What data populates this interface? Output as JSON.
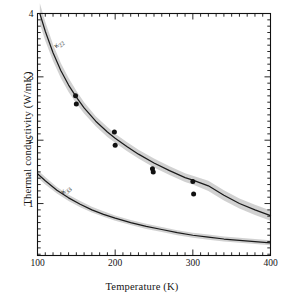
{
  "chart_data": {
    "type": "line",
    "title": "",
    "xlabel": "Temperature (K)",
    "ylabel": "Thermal conductivity (W/mK)",
    "xlim": [
      100,
      400
    ],
    "ylim": [
      0.18,
      4.0
    ],
    "grid": false,
    "legend_position": "inline-curve-labels",
    "xticks": [
      100,
      200,
      300,
      400
    ],
    "xtick_labels": [
      "100",
      "200",
      "300",
      "400"
    ],
    "yticks": [
      1,
      2,
      3,
      4
    ],
    "ytick_labels": [
      "1",
      "2",
      "3",
      "4"
    ],
    "minor_ticks": true,
    "band_color": "#c9c9c9",
    "curve_color": "#1a1a1a",
    "marker_color": "#111111",
    "series": [
      {
        "name": "kappa_22",
        "label": "κ",
        "label_sub": "22",
        "label_x": 122,
        "label_y": 3.47,
        "x": [
          103,
          110,
          120,
          130,
          140,
          150,
          160,
          175,
          190,
          200,
          215,
          230,
          250,
          270,
          290,
          300,
          320,
          340,
          360,
          380,
          400
        ],
        "values": [
          4.0,
          3.72,
          3.38,
          3.1,
          2.87,
          2.68,
          2.51,
          2.3,
          2.13,
          2.03,
          1.9,
          1.78,
          1.64,
          1.52,
          1.41,
          1.37,
          1.28,
          1.13,
          1.0,
          0.9,
          0.81
        ],
        "band_lower": [
          3.84,
          3.57,
          3.25,
          2.98,
          2.76,
          2.58,
          2.42,
          2.22,
          2.05,
          1.96,
          1.83,
          1.71,
          1.57,
          1.45,
          1.34,
          1.3,
          1.2,
          1.05,
          0.92,
          0.82,
          0.73
        ],
        "band_upper": [
          4.16,
          3.87,
          3.51,
          3.22,
          2.98,
          2.78,
          2.6,
          2.38,
          2.21,
          2.1,
          1.97,
          1.85,
          1.71,
          1.59,
          1.48,
          1.44,
          1.36,
          1.21,
          1.08,
          0.98,
          0.89
        ]
      },
      {
        "name": "kappa_33",
        "label": "κ",
        "label_sub": "33",
        "label_x": 131,
        "label_y": 1.17,
        "x": [
          100,
          110,
          125,
          140,
          155,
          170,
          185,
          200,
          220,
          240,
          260,
          280,
          300,
          320,
          340,
          360,
          380,
          400
        ],
        "values": [
          1.47,
          1.36,
          1.21,
          1.09,
          0.99,
          0.9,
          0.83,
          0.77,
          0.7,
          0.64,
          0.59,
          0.54,
          0.5,
          0.47,
          0.44,
          0.42,
          0.4,
          0.38
        ],
        "band_lower": [
          1.41,
          1.3,
          1.16,
          1.04,
          0.94,
          0.86,
          0.79,
          0.73,
          0.66,
          0.6,
          0.55,
          0.5,
          0.46,
          0.43,
          0.4,
          0.38,
          0.36,
          0.34
        ],
        "band_upper": [
          1.53,
          1.42,
          1.26,
          1.14,
          1.04,
          0.95,
          0.88,
          0.81,
          0.74,
          0.68,
          0.63,
          0.58,
          0.54,
          0.51,
          0.48,
          0.46,
          0.44,
          0.42
        ]
      }
    ],
    "scatter": {
      "name": "measured-points",
      "x": [
        149,
        150,
        199,
        200,
        248,
        249,
        300,
        301
      ],
      "y": [
        2.7,
        2.57,
        2.13,
        1.92,
        1.55,
        1.5,
        1.35,
        1.15
      ]
    }
  }
}
